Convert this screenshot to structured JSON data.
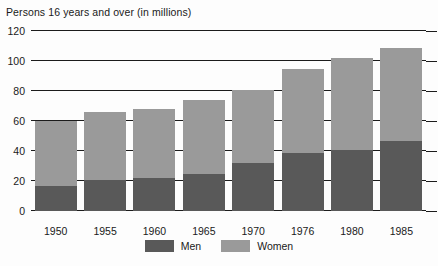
{
  "chart_data": {
    "type": "bar",
    "subtype": "stacked-vertical",
    "title": "Persons 16 years and over (in millions)",
    "xlabel": "",
    "ylabel": "",
    "categories": [
      "1950",
      "1955",
      "1960",
      "1965",
      "1970",
      "1976",
      "1980",
      "1985"
    ],
    "series": [
      {
        "name": "Men",
        "color": "#595959",
        "values": [
          17,
          21,
          22,
          25,
          32,
          39,
          41,
          47
        ]
      },
      {
        "name": "Women",
        "color": "#9a9a9a",
        "values": [
          43,
          45,
          46,
          49,
          49,
          56,
          61,
          62
        ]
      }
    ],
    "totals": [
      60,
      66,
      68,
      74,
      81,
      95,
      102,
      109
    ],
    "ylim": [
      0,
      120
    ],
    "yticks": [
      0,
      20,
      40,
      60,
      80,
      100,
      120
    ],
    "ytick_labels": [
      "0",
      "20",
      "40",
      "60",
      "80",
      "100",
      "120"
    ],
    "grid": true,
    "grid_axis": "y",
    "legend_position": "bottom-center"
  },
  "legend": {
    "items": [
      {
        "label": "Men",
        "color": "#595959"
      },
      {
        "label": "Women",
        "color": "#9a9a9a"
      }
    ]
  },
  "colors": {
    "men": "#595959",
    "women": "#9a9a9a",
    "axis": "#1c1c1c",
    "text": "#1a1a1a",
    "background": "#fdfdfd"
  }
}
